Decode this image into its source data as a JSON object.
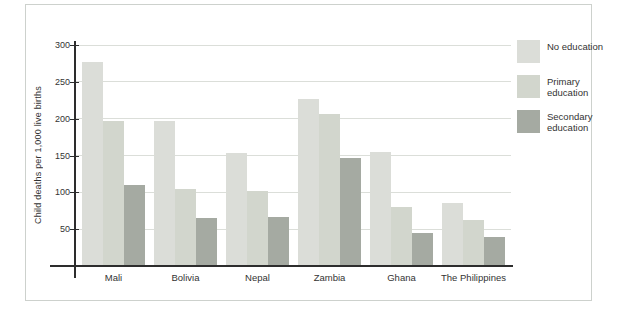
{
  "chart_data": {
    "type": "bar",
    "title": "",
    "xlabel": "",
    "ylabel": "Child deaths per 1,000 live births",
    "ylim": [
      0,
      300
    ],
    "yticks": [
      50,
      100,
      150,
      200,
      250,
      300
    ],
    "grid": true,
    "legend_position": "right",
    "categories": [
      "Mali",
      "Bolivia",
      "Nepal",
      "Zambia",
      "Ghana",
      "The Philippines"
    ],
    "series": [
      {
        "name": "No education",
        "color": "#dbddd8",
        "values": [
          277,
          197,
          153,
          227,
          155,
          85
        ]
      },
      {
        "name": "Primary education",
        "color": "#d2d6cd",
        "values": [
          197,
          105,
          102,
          207,
          80,
          63
        ]
      },
      {
        "name": "Secondary education",
        "color": "#a5aaa2",
        "values": [
          110,
          65,
          67,
          146,
          45,
          40
        ]
      }
    ]
  },
  "colors": {
    "axis": "#2d2d2d",
    "gridline": "#dbded9",
    "panel_border": "#cdd1cd",
    "text": "#333333",
    "background": "#ffffff"
  }
}
